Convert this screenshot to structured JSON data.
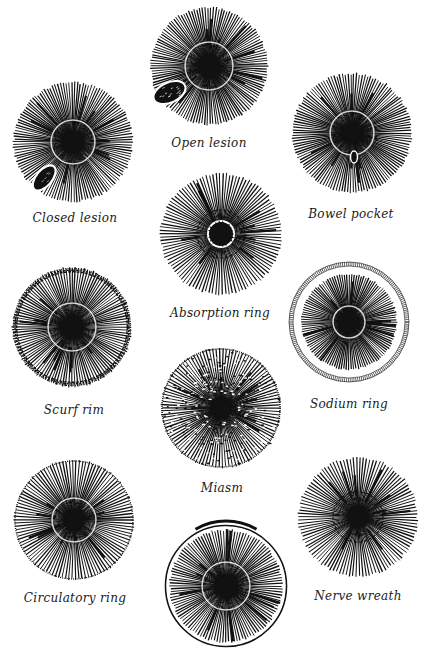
{
  "figure": {
    "title": "",
    "background": "#ffffff",
    "ink": "#111111",
    "irises": [
      {
        "id": "open-lesion",
        "label": "Open lesion",
        "cx": 209,
        "cy": 66,
        "r": 59,
        "label_x": 209,
        "label_y": 136,
        "feature": "open-lesion",
        "pupil_r": 10,
        "wreath_r": 24,
        "fibers": 130
      },
      {
        "id": "closed-lesion",
        "label": "Closed lesion",
        "cx": 73,
        "cy": 142,
        "r": 60,
        "label_x": 75,
        "label_y": 211,
        "feature": "closed-lesion",
        "pupil_r": 10,
        "wreath_r": 22,
        "fibers": 130
      },
      {
        "id": "bowel-pocket",
        "label": "Bowel pocket",
        "cx": 352,
        "cy": 133,
        "r": 60,
        "label_x": 351,
        "label_y": 207,
        "feature": "bowel-pocket",
        "pupil_r": 9,
        "wreath_r": 22,
        "fibers": 130
      },
      {
        "id": "absorption-ring",
        "label": "Absorption ring",
        "cx": 221,
        "cy": 234,
        "r": 61,
        "label_x": 220,
        "label_y": 306,
        "feature": "absorption-ring",
        "pupil_r": 10,
        "wreath_r": 24,
        "fibers": 110
      },
      {
        "id": "scurf-rim",
        "label": "Scurf rim",
        "cx": 72,
        "cy": 327,
        "r": 60,
        "label_x": 74,
        "label_y": 403,
        "feature": "scurf-rim",
        "pupil_r": 11,
        "wreath_r": 24,
        "fibers": 120
      },
      {
        "id": "sodium-ring",
        "label": "Sodium ring",
        "cx": 349,
        "cy": 322,
        "r": 60,
        "label_x": 349,
        "label_y": 397,
        "feature": "sodium-ring",
        "pupil_r": 10,
        "wreath_r": 16,
        "fibers": 120
      },
      {
        "id": "miasm",
        "label": "Miasm",
        "cx": 221,
        "cy": 408,
        "r": 60,
        "label_x": 222,
        "label_y": 481,
        "feature": "miasm",
        "pupil_r": 10,
        "wreath_r": 0,
        "fibers": 110
      },
      {
        "id": "circulatory-ring",
        "label": "Circulatory ring",
        "cx": 74,
        "cy": 520,
        "r": 60,
        "label_x": 75,
        "label_y": 591,
        "feature": "circulatory-ring",
        "pupil_r": 10,
        "wreath_r": 22,
        "fibers": 110
      },
      {
        "id": "unlabeled-arcus",
        "label": "",
        "cx": 226,
        "cy": 586,
        "r": 61,
        "label_x": 226,
        "label_y": 660,
        "feature": "arcus",
        "pupil_r": 11,
        "wreath_r": 24,
        "fibers": 120
      },
      {
        "id": "nerve-wreath",
        "label": "Nerve wreath",
        "cx": 358,
        "cy": 517,
        "r": 60,
        "label_x": 358,
        "label_y": 589,
        "feature": "nerve-wreath",
        "pupil_r": 10,
        "wreath_r": 25,
        "fibers": 110
      }
    ]
  }
}
